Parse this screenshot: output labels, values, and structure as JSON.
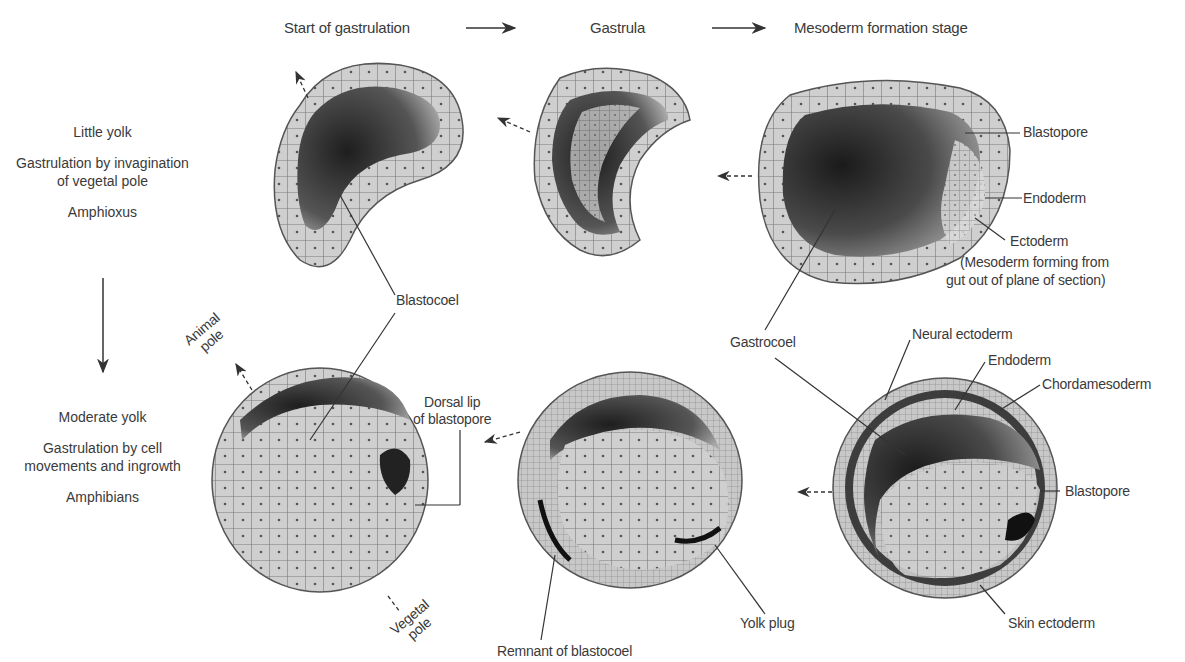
{
  "stages": {
    "start": "Start of gastrulation",
    "gastrula": "Gastrula",
    "mesoderm": "Mesoderm formation stage"
  },
  "amphioxus_row": {
    "yolk": "Little yolk",
    "method_line1": "Gastrulation by invagination",
    "method_line2": "of vegetal pole",
    "organism": "Amphioxus"
  },
  "amphibian_row": {
    "yolk": "Moderate yolk",
    "method_line1": "Gastrulation by cell",
    "method_line2": "movements and ingrowth",
    "organism": "Amphibians"
  },
  "labels": {
    "blastopore_top": "Blastopore",
    "endoderm_top": "Endoderm",
    "ectoderm_top": "Ectoderm",
    "mesoderm_note_line1": "(Mesoderm forming from",
    "mesoderm_note_line2": "gut out of plane of section)",
    "blastocoel": "Blastocoel",
    "gastrocoel": "Gastrocoel",
    "animal_pole_line1": "Animal",
    "animal_pole_line2": "pole",
    "dorsal_lip_line1": "Dorsal lip",
    "dorsal_lip_line2": "of blastopore",
    "neural_ectoderm": "Neural ectoderm",
    "endoderm_bottom": "Endoderm",
    "chordamesoderm": "Chordamesoderm",
    "blastopore_bottom": "Blastopore",
    "vegetal_pole_line1": "Vegetal",
    "vegetal_pole_line2": "pole",
    "yolk_plug": "Yolk plug",
    "remnant_blastocoel": "Remnant of blastocoel",
    "skin_ectoderm": "Skin ectoderm"
  },
  "colors": {
    "text": "#3a3a3a",
    "line": "#333333",
    "cell_light": "#e6e6e6",
    "cell_mid": "#b5b5b5",
    "cavity_dark": "#2a2a2a"
  }
}
